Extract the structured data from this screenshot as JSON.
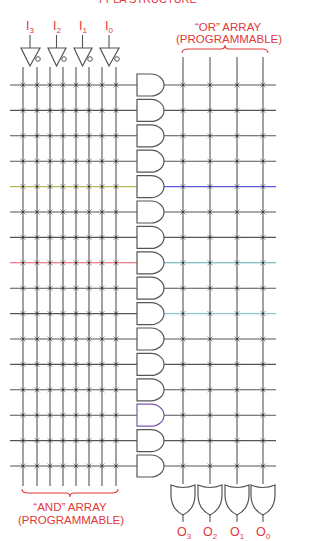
{
  "title_clipped": "FPLA STRUCTURE",
  "labels": {
    "inputs": [
      {
        "letter": "I",
        "sub": "3",
        "x": 30
      },
      {
        "letter": "I",
        "sub": "2",
        "x": 57
      },
      {
        "letter": "I",
        "sub": "1",
        "x": 83
      },
      {
        "letter": "I",
        "sub": "0",
        "x": 109
      }
    ],
    "outputs": [
      {
        "letter": "O",
        "sub": "3",
        "x": 184
      },
      {
        "letter": "O",
        "sub": "2",
        "x": 210
      },
      {
        "letter": "O",
        "sub": "1",
        "x": 237
      },
      {
        "letter": "O",
        "sub": "0",
        "x": 263
      }
    ],
    "or_array_line1": "“OR” ARRAY",
    "or_array_line2": "(PROGRAMMABLE)",
    "and_array_line1": "“AND” ARRAY",
    "and_array_line2": "(PROGRAMMABLE)"
  },
  "colors": {
    "line": "#555555",
    "label": "#e0393b",
    "highlight_left_1": "#b8b85a",
    "highlight_left_2": "#e05a6a",
    "highlight_right_1": "#5a5ae0",
    "highlight_right_2": "#5aa8b0",
    "highlight_gate": "#7a5ab0"
  },
  "diagram": {
    "and_columns_x": [
      23,
      37,
      50,
      63,
      76,
      89,
      102,
      116
    ],
    "or_columns_x": [
      183,
      210,
      237,
      263
    ],
    "row_first_y": 85,
    "row_spacing": 25.4,
    "row_count": 16,
    "highlight_rows_left": {
      "4": "#b8b85a",
      "7": "#e05a6a"
    },
    "highlight_rows_right": {
      "4": "#5a5ae0",
      "7": "#5aa8b0",
      "9": "#8ac8d0"
    },
    "highlight_gate_rows": {
      "13": "#7a5ab0"
    }
  }
}
